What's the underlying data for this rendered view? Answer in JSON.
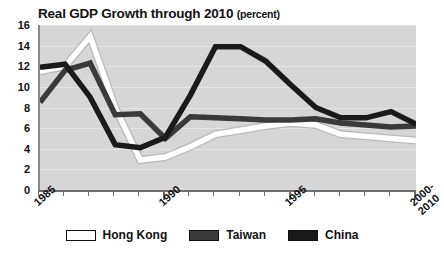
{
  "chart_data": {
    "type": "line",
    "title": "Real GDP Growth through 2010",
    "title_unit": "(percent)",
    "xlabel": "",
    "ylabel": "",
    "ylim": [
      0,
      16
    ],
    "xlim": [
      1985,
      2000
    ],
    "grid": true,
    "legend_position": "bottom",
    "y_ticks": [
      16,
      14,
      12,
      10,
      8,
      6,
      4,
      2,
      0
    ],
    "x_tick_labels": [
      "1985",
      "1990",
      "1995",
      "2000-\n2010"
    ],
    "x_tick_years": [
      1985,
      1990,
      1995,
      2000
    ],
    "x": [
      1985,
      1986,
      1987,
      1988,
      1989,
      1990,
      1991,
      1992,
      1993,
      1994,
      1995,
      1996,
      1997,
      1998,
      1999,
      2000
    ],
    "series": [
      {
        "name": "Hong Kong",
        "color": "#ffffff",
        "values": [
          11.5,
          12.0,
          14.9,
          8.0,
          2.9,
          3.2,
          4.2,
          5.4,
          5.8,
          6.2,
          6.5,
          6.3,
          5.4,
          5.2,
          5.0,
          4.8
        ]
      },
      {
        "name": "Taiwan",
        "color": "#3a3a3a",
        "values": [
          8.5,
          11.6,
          12.3,
          7.3,
          7.4,
          5.0,
          7.1,
          7.0,
          6.9,
          6.8,
          6.8,
          6.9,
          6.5,
          6.3,
          6.1,
          6.2
        ]
      },
      {
        "name": "China",
        "color": "#1a1a1a",
        "values": [
          11.9,
          12.2,
          9.0,
          4.4,
          4.1,
          5.1,
          9.2,
          13.9,
          13.9,
          12.5,
          10.2,
          8.0,
          7.0,
          7.0,
          7.6,
          6.4
        ]
      }
    ],
    "legend": [
      {
        "label": "Hong Kong",
        "swatch": "#ffffff"
      },
      {
        "label": "Taiwan",
        "swatch": "#3a3a3a"
      },
      {
        "label": "China",
        "swatch": "#1a1a1a"
      }
    ],
    "plot_background": "#d6d6d6"
  }
}
